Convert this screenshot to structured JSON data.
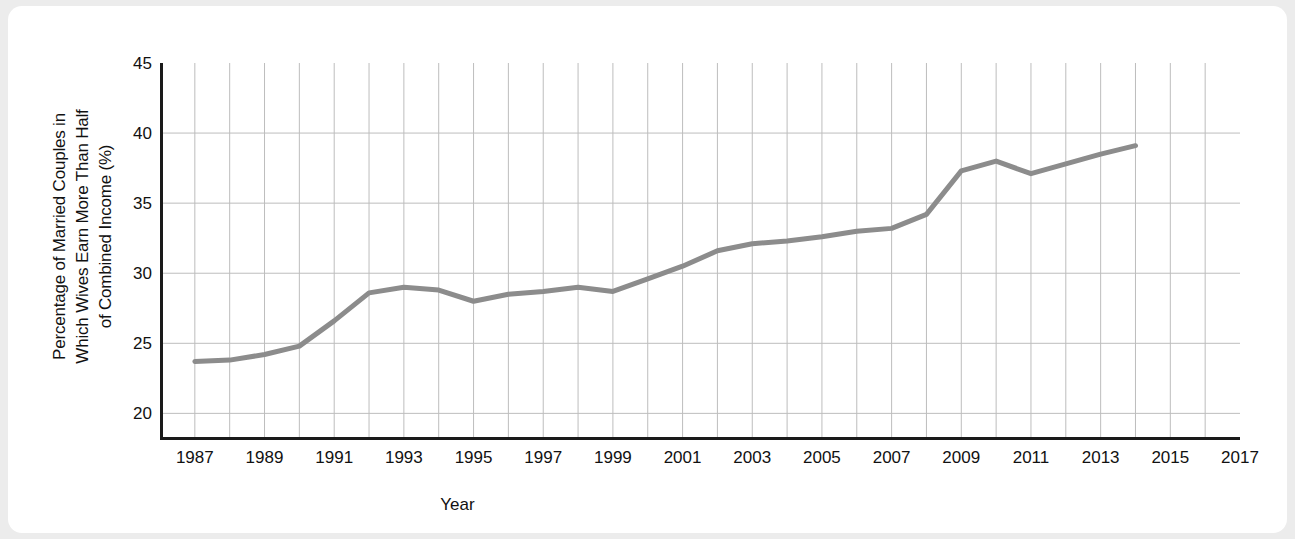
{
  "chart_data": {
    "type": "line",
    "title": "",
    "xlabel": "Year",
    "ylabel": "Percentage of Married Couples in Which Wives Earn More Than Half of Combined Income (%)",
    "ylabel_lines": [
      "Percentage of Married Couples in",
      "Which Wives Earn More Than Half",
      "of Combined Income (%)"
    ],
    "xlim": [
      1986,
      2017
    ],
    "ylim": [
      18.1,
      45
    ],
    "ytick_values": [
      45,
      40,
      35,
      30,
      25,
      20
    ],
    "ytick_labels": [
      "45",
      "40",
      "35",
      "30",
      "25",
      "20"
    ],
    "xtick_values": [
      1987,
      1989,
      1991,
      1993,
      1995,
      1997,
      1999,
      2001,
      2003,
      2005,
      2007,
      2009,
      2011,
      2013,
      2015,
      2017
    ],
    "xtick_labels": [
      "1987",
      "1989",
      "1991",
      "1993",
      "1995",
      "1997",
      "1999",
      "2001",
      "2003",
      "2005",
      "2007",
      "2009",
      "2011",
      "2013",
      "2015",
      "2017"
    ],
    "grid": "both",
    "grid_x_step": 1,
    "grid_y_step": 5,
    "legend": "none",
    "line_color": "#8c8c8c",
    "line_width": 5,
    "axis_color": "#1a1a1a",
    "grid_color": "#bdbdbd",
    "background": "#ffffff",
    "page_background": "#ececec",
    "x": [
      1987,
      1988,
      1989,
      1990,
      1991,
      1992,
      1993,
      1994,
      1995,
      1996,
      1997,
      1998,
      1999,
      2000,
      2001,
      2002,
      2003,
      2004,
      2005,
      2006,
      2007,
      2008,
      2009,
      2010,
      2011,
      2012,
      2013,
      2014
    ],
    "values": [
      23.7,
      23.8,
      24.2,
      24.8,
      26.6,
      28.6,
      29.0,
      28.8,
      28.0,
      28.5,
      28.7,
      29.0,
      28.7,
      29.6,
      30.5,
      31.6,
      32.1,
      32.3,
      32.6,
      33.0,
      33.2,
      34.2,
      37.3,
      38.0,
      37.1,
      37.8,
      38.5,
      39.1
    ]
  }
}
